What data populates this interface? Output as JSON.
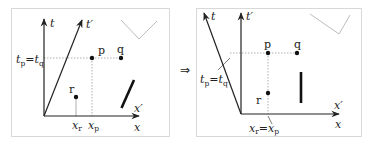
{
  "diagram": {
    "type": "spacetime-diagram",
    "transition_symbol": "⇒",
    "panels": [
      {
        "name": "before",
        "axes": {
          "t": "t",
          "t_prime": "t′",
          "x": "x",
          "x_prime": "x′"
        },
        "events": [
          {
            "label": "p"
          },
          {
            "label": "q"
          },
          {
            "label": "r"
          }
        ],
        "annotations": {
          "equal_times": {
            "t1": "t",
            "s1": "p",
            "eq": "=",
            "t2": "t",
            "s2": "q"
          },
          "x_r": {
            "v": "x",
            "s": "r"
          },
          "x_p": {
            "v": "x",
            "s": "p"
          }
        }
      },
      {
        "name": "after",
        "axes": {
          "t": "t",
          "t_prime": "t′",
          "x": "x",
          "x_prime": "x′"
        },
        "events": [
          {
            "label": "p"
          },
          {
            "label": "q"
          },
          {
            "label": "r"
          }
        ],
        "annotations": {
          "equal_times": {
            "t1": "t",
            "s1": "p",
            "eq": "=",
            "t2": "t",
            "s2": "q"
          },
          "equal_positions": {
            "v1": "x",
            "s1": "r",
            "eq": "=",
            "v2": "x",
            "s2": "p"
          }
        }
      }
    ],
    "colors": {
      "ink": "#222222",
      "frame": "#d8d8d8",
      "dotted": "#9a9a9a",
      "check": "#b5b5b5"
    }
  }
}
